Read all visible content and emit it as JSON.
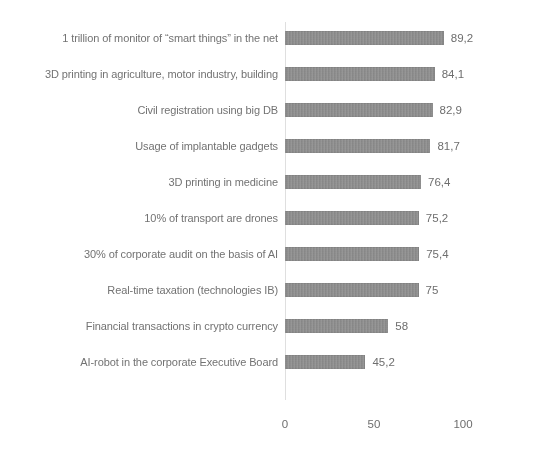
{
  "chart_data": {
    "type": "bar",
    "orientation": "horizontal",
    "title": "",
    "subtitle": "",
    "xlabel": "",
    "ylabel": "",
    "xlim": [
      0,
      100
    ],
    "xticks": [
      "0",
      "50",
      "100"
    ],
    "xtick_values": [
      0,
      50,
      100
    ],
    "grid": false,
    "legend": false,
    "decimal_separator": ",",
    "bar_color": "#8a8a8a",
    "text_color": "#6a6a6a",
    "categories": [
      "1 trillion of monitor of “smart things” in the net",
      "3D printing in agriculture, motor industry, building",
      "Civil registration using big DB",
      "Usage of implantable gadgets",
      "3D printing in medicine",
      "10% of transport are drones",
      "30% of corporate audit on the basis of AI",
      "Real-time taxation (technologies IB)",
      "Financial transactions in crypto currency",
      "AI-robot in the corporate Executive Board"
    ],
    "values": [
      89.2,
      84.1,
      82.9,
      81.7,
      76.4,
      75.2,
      75.4,
      75,
      58,
      45.2
    ],
    "value_labels": [
      "89,2",
      "84,1",
      "82,9",
      "81,7",
      "76,4",
      "75,2",
      "75,4",
      "75",
      "58",
      "45,2"
    ]
  }
}
